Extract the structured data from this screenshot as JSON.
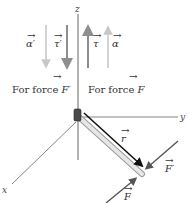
{
  "diagram": {
    "axes": {
      "x": "x",
      "y": "y",
      "z": "z"
    },
    "left_group": {
      "caption": "For force F′",
      "caption_prefix": "For force ",
      "caption_symbol": "F′",
      "vectors": [
        {
          "label": "α′",
          "direction": "down",
          "color": "#c8c8c8"
        },
        {
          "label": "τ′",
          "direction": "down",
          "color": "#8e8e8e"
        }
      ]
    },
    "right_group": {
      "caption": "For force F",
      "caption_prefix": "For force ",
      "caption_symbol": "F",
      "vectors": [
        {
          "label": "τ",
          "direction": "up",
          "color": "#8e8e8e"
        },
        {
          "label": "α",
          "direction": "up",
          "color": "#c8c8c8"
        }
      ]
    },
    "rod": {
      "position_vector_label": "r"
    },
    "forces": [
      {
        "label": "F′",
        "color": "#555555"
      },
      {
        "label": "F",
        "color": "#555555"
      }
    ],
    "colors": {
      "axis": "#666666",
      "light_vector": "#c8c8c8",
      "mid_vector": "#8e8e8e",
      "r_vector": "#111111",
      "rod_fill": "#e6e6e6",
      "pivot": "#4a4a4a"
    }
  }
}
